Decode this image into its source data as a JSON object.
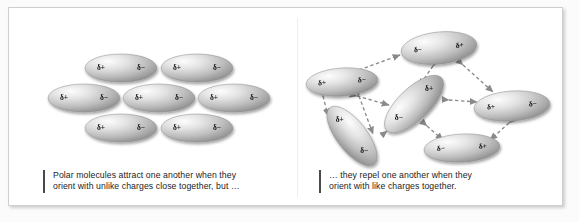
{
  "figure": {
    "background_color": "#ffffff",
    "border_color": "#cfcfcf"
  },
  "symbols": {
    "delta_positive": "δ+",
    "delta_negative": "δ−"
  },
  "panels": {
    "left": {
      "name": "attraction-panel",
      "caption_line1": "Polar molecules attract one another when they",
      "caption_line2": "orient with unlike charges close together, but …",
      "molecule_count": 7,
      "molecules": [
        {
          "id": "L1",
          "row": 1,
          "cx": 112,
          "cy": 60,
          "rx": 36,
          "ry": 14,
          "angle": 0,
          "left_charge": "δ+",
          "right_charge": "δ−"
        },
        {
          "id": "L2",
          "row": 1,
          "cx": 188,
          "cy": 60,
          "rx": 36,
          "ry": 14,
          "angle": 0,
          "left_charge": "δ+",
          "right_charge": "δ−"
        },
        {
          "id": "L3",
          "row": 2,
          "cx": 75,
          "cy": 90,
          "rx": 36,
          "ry": 14,
          "angle": 0,
          "left_charge": "δ+",
          "right_charge": "δ−"
        },
        {
          "id": "L4",
          "row": 2,
          "cx": 150,
          "cy": 90,
          "rx": 36,
          "ry": 14,
          "angle": 0,
          "left_charge": "δ+",
          "right_charge": "δ−"
        },
        {
          "id": "L5",
          "row": 2,
          "cx": 225,
          "cy": 90,
          "rx": 36,
          "ry": 14,
          "angle": 0,
          "left_charge": "δ+",
          "right_charge": "δ−"
        },
        {
          "id": "L6",
          "row": 3,
          "cx": 112,
          "cy": 120,
          "rx": 36,
          "ry": 14,
          "angle": 0,
          "left_charge": "δ+",
          "right_charge": "δ−"
        },
        {
          "id": "L7",
          "row": 3,
          "cx": 188,
          "cy": 120,
          "rx": 36,
          "ry": 14,
          "angle": 0,
          "left_charge": "δ+",
          "right_charge": "δ−"
        }
      ]
    },
    "right": {
      "name": "repulsion-panel",
      "caption_line1": "… they repel one another when they",
      "caption_line2": "orient with like charges together.",
      "molecule_count": 6,
      "arrow_count": 9,
      "arrow_style": "dashed double-headed",
      "molecules": [
        {
          "id": "R1",
          "label": "top",
          "cx": 142,
          "cy": 40,
          "rx": 38,
          "ry": 16,
          "angle": -6,
          "left_charge": "δ−",
          "right_charge": "δ+"
        },
        {
          "id": "R2",
          "label": "upper-left",
          "cx": 45,
          "cy": 74,
          "rx": 36,
          "ry": 14,
          "angle": -4,
          "left_charge": "δ+",
          "right_charge": "δ−"
        },
        {
          "id": "R3",
          "label": "center",
          "cx": 117,
          "cy": 96,
          "rx": 38,
          "ry": 16,
          "angle": -44,
          "left_charge": "δ−",
          "right_charge": "δ+"
        },
        {
          "id": "R4",
          "label": "right",
          "cx": 215,
          "cy": 98,
          "rx": 38,
          "ry": 15,
          "angle": -4,
          "left_charge": "δ+",
          "right_charge": "δ−"
        },
        {
          "id": "R5",
          "label": "lower-left",
          "cx": 55,
          "cy": 128,
          "rx": 36,
          "ry": 15,
          "angle": 52,
          "left_charge": "δ+",
          "right_charge": "δ−"
        },
        {
          "id": "R6",
          "label": "bottom",
          "cx": 165,
          "cy": 140,
          "rx": 38,
          "ry": 14,
          "angle": -3,
          "left_charge": "δ−",
          "right_charge": "δ+"
        }
      ],
      "arrows": [
        {
          "from": "R2",
          "to": "R1"
        },
        {
          "from": "R1",
          "to": "R3"
        },
        {
          "from": "R1",
          "to": "R4"
        },
        {
          "from": "R2",
          "to": "R3"
        },
        {
          "from": "R2",
          "to": "R5"
        },
        {
          "from": "R5",
          "to": "R3"
        },
        {
          "from": "R3",
          "to": "R4"
        },
        {
          "from": "R3",
          "to": "R6"
        },
        {
          "from": "R4",
          "to": "R6"
        }
      ]
    }
  }
}
